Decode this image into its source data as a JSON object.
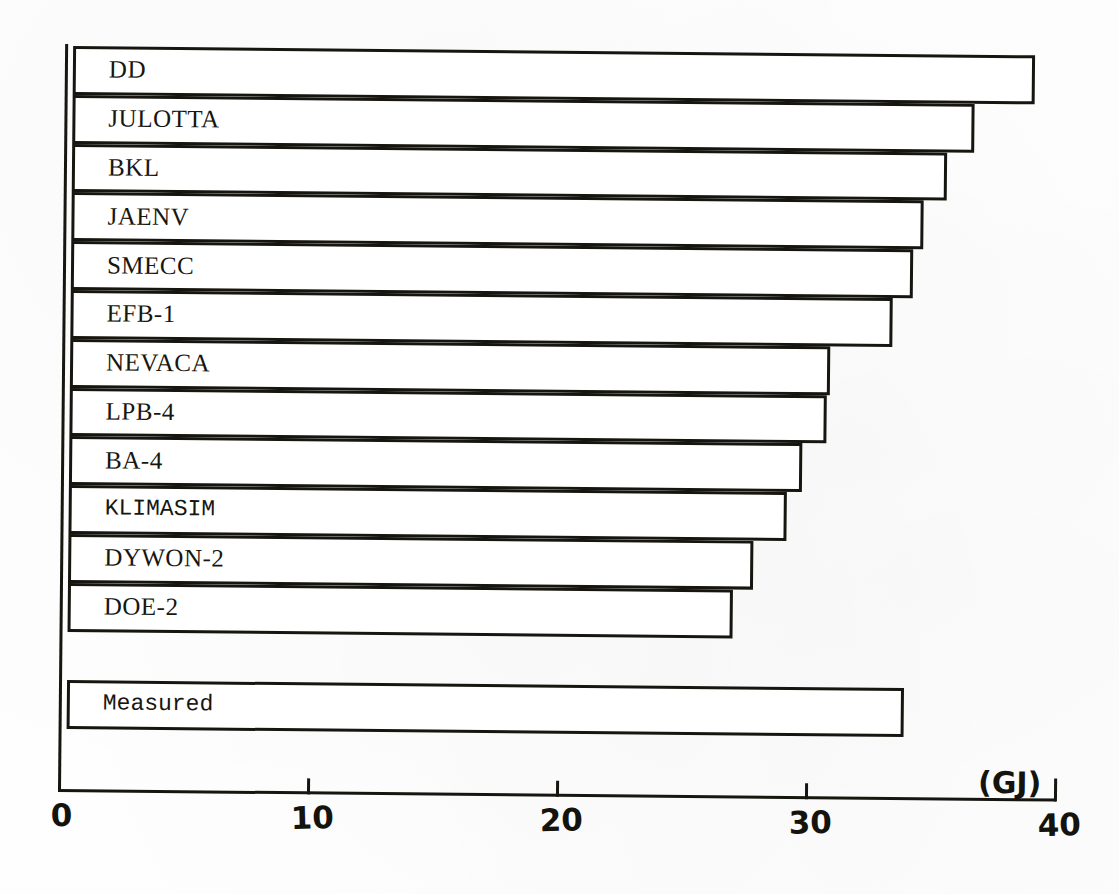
{
  "chart_data": {
    "type": "bar",
    "orientation": "horizontal",
    "title": "",
    "xlabel": "(GJ)",
    "ylabel": "",
    "xlim": [
      0,
      40
    ],
    "xticks": [
      0,
      10,
      20,
      30,
      40
    ],
    "xtick_labels": [
      "0",
      "10",
      "20",
      "30",
      "40"
    ],
    "grid": false,
    "legend": null,
    "categories": [
      "DD",
      "JULOTTA",
      "BKL",
      "JAENV",
      "SMECC",
      "EFB-1",
      "NEVACA",
      "LPB-4",
      "BA-4",
      "KLIMASIM",
      "DYWON-2",
      "DOE-2",
      "Measured"
    ],
    "values": [
      38.9,
      36.5,
      35.4,
      34.5,
      34.1,
      33.3,
      30.8,
      30.7,
      29.7,
      29.1,
      27.8,
      27.0,
      33.9
    ],
    "bars": [
      {
        "label": "DD",
        "value": 38.9,
        "group": "simulated",
        "font": "serif"
      },
      {
        "label": "JULOTTA",
        "value": 36.5,
        "group": "simulated",
        "font": "serif"
      },
      {
        "label": "BKL",
        "value": 35.4,
        "group": "simulated",
        "font": "serif"
      },
      {
        "label": "JAENV",
        "value": 34.5,
        "group": "simulated",
        "font": "serif"
      },
      {
        "label": "SMECC",
        "value": 34.1,
        "group": "simulated",
        "font": "serif"
      },
      {
        "label": "EFB-1",
        "value": 33.3,
        "group": "simulated",
        "font": "serif"
      },
      {
        "label": "NEVACA",
        "value": 30.8,
        "group": "simulated",
        "font": "serif"
      },
      {
        "label": "LPB-4",
        "value": 30.7,
        "group": "simulated",
        "font": "serif"
      },
      {
        "label": "BA-4",
        "value": 29.7,
        "group": "simulated",
        "font": "serif"
      },
      {
        "label": "KLIMASIM",
        "value": 29.1,
        "group": "simulated",
        "font": "mono"
      },
      {
        "label": "DYWON-2",
        "value": 27.8,
        "group": "simulated",
        "font": "serif"
      },
      {
        "label": "DOE-2",
        "value": 27.0,
        "group": "simulated",
        "font": "serif"
      },
      {
        "label": "Measured",
        "value": 33.9,
        "group": "measured",
        "font": "mono"
      }
    ],
    "colors": {
      "ink": "#16150f",
      "bar_fill": "#ffffff",
      "paper": "#fefefe"
    }
  }
}
